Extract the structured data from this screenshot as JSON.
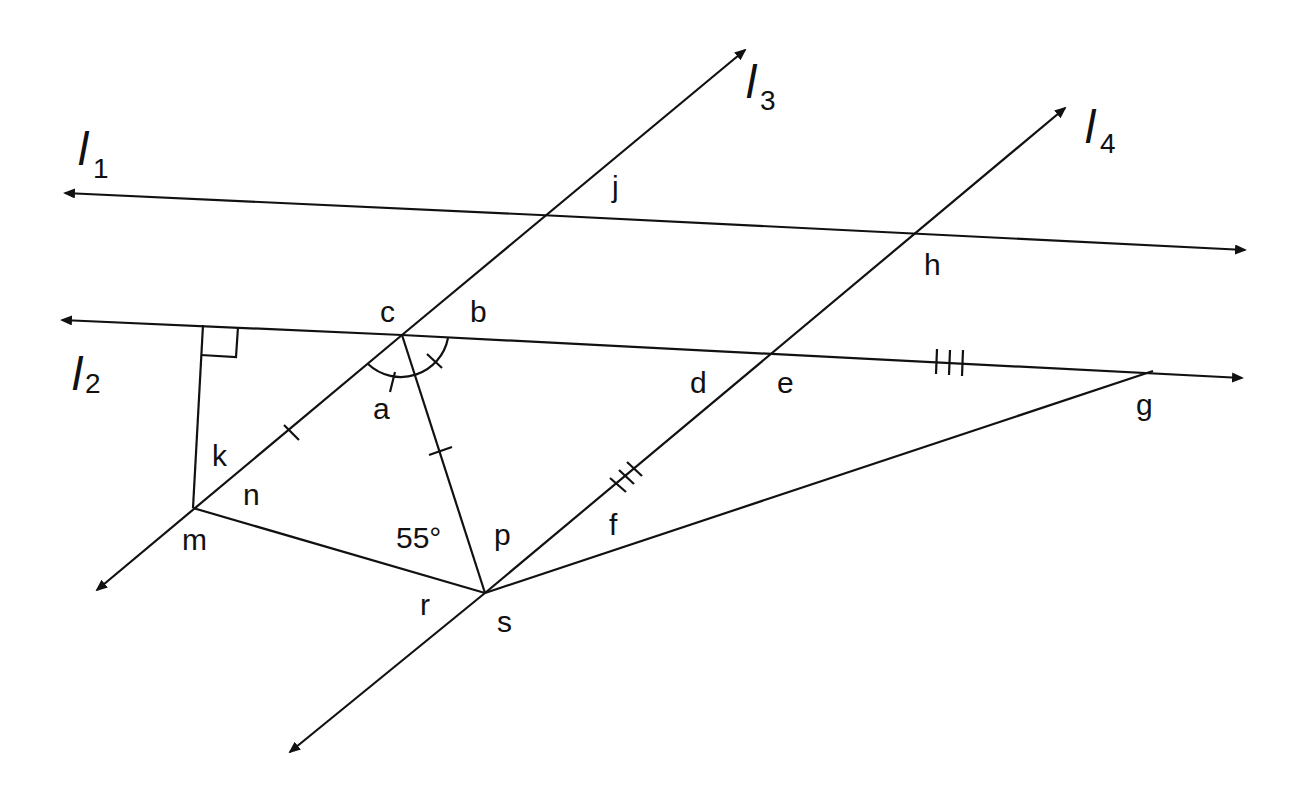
{
  "diagram": {
    "stroke_color": "#111111",
    "background": "#ffffff",
    "lines": [
      {
        "id": "l1",
        "name": "l",
        "sub": "1"
      },
      {
        "id": "l2",
        "name": "l",
        "sub": "2"
      },
      {
        "id": "l3",
        "name": "l",
        "sub": "3"
      },
      {
        "id": "l4",
        "name": "l",
        "sub": "4"
      }
    ],
    "angle_labels": {
      "a": "a",
      "b": "b",
      "c": "c",
      "d": "d",
      "e": "e",
      "f": "f",
      "g": "g",
      "h": "h",
      "j": "j",
      "k": "k",
      "m": "m",
      "n": "n",
      "p": "p",
      "r": "r",
      "s": "s"
    },
    "given_angle": "55°",
    "markings": {
      "right_angle": "right angle between segment from m and line l2",
      "single_tick": "segments from c along l3 and c to s are congruent",
      "triple_tick": "segments on l2 and on l4 are congruent",
      "arc": "angles at c bisected/equal marks"
    }
  }
}
